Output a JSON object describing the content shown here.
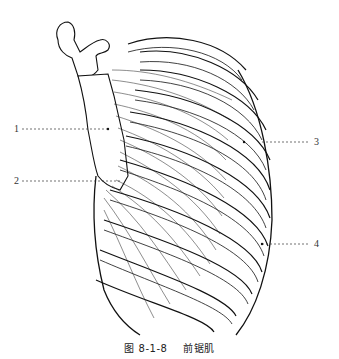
{
  "figure": {
    "labels": [
      {
        "id": "1",
        "text": "1",
        "side": "left"
      },
      {
        "id": "2",
        "text": "2",
        "side": "left"
      },
      {
        "id": "3",
        "text": "3",
        "side": "right"
      },
      {
        "id": "4",
        "text": "4",
        "side": "right"
      }
    ]
  },
  "caption": {
    "number": "图 8-1-8",
    "title": "前锯肌"
  }
}
